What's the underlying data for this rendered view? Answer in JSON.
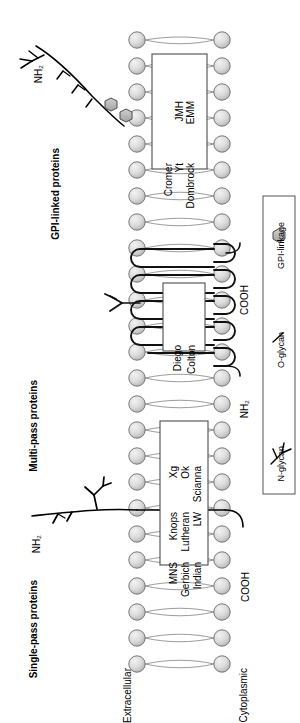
{
  "figure": {
    "orientation": "rotated-90"
  },
  "sections": [
    {
      "id": "gpi",
      "label": "GPI-linked proteins"
    },
    {
      "id": "multipass",
      "label": "Multi-pass proteins"
    },
    {
      "id": "singlepass",
      "label": "Single-pass proteins"
    }
  ],
  "membrane": {
    "extracellular_label": "Extracellular",
    "cytoplasmic_label": "Cytoplasmic",
    "lipid_head_color": "#d9d9d9",
    "lipid_head_stroke": "#6b6b6b",
    "lipid_tail_color": "#8a8a8a"
  },
  "protein_boxes": [
    {
      "id": "gpi-box",
      "section": "gpi",
      "columns": [
        {
          "items": [
            "Cromer",
            "Yt",
            "Dombrock"
          ]
        },
        {
          "items": [
            "JMH",
            "EMM"
          ]
        }
      ]
    },
    {
      "id": "multipass-box",
      "section": "multipass",
      "columns": [
        {
          "items": [
            "Diego",
            "Colton"
          ]
        }
      ]
    },
    {
      "id": "singlepass-box",
      "section": "singlepass",
      "columns": [
        {
          "items": [
            "MNS",
            "Gerbich",
            "Indian"
          ]
        },
        {
          "items": [
            "Knops",
            "Lutheran",
            "LW"
          ]
        },
        {
          "items": [
            "Xg",
            "Ok",
            "Scianna"
          ]
        }
      ]
    }
  ],
  "terminus_labels": {
    "gpi_nh2": "NH₂",
    "multipass_cooh": "COOH",
    "multipass_nh2": "NH₂",
    "singlepass_nh2": "NH₂",
    "singlepass_cooh": "COOH"
  },
  "legend": {
    "items": [
      {
        "symbol": "gpi-linkage-hexagon",
        "label": "GPI-linkage"
      },
      {
        "symbol": "o-glycan-tick",
        "label": "O-glycan"
      },
      {
        "symbol": "n-glycan-branch",
        "label": "N-glycan"
      }
    ],
    "border_color": "#555555"
  },
  "colors": {
    "ink": "#000000",
    "hexagon_fill": "#b3b3b3",
    "box_stroke": "#4d4d4d",
    "protein_stroke": "#1a1a1a"
  }
}
